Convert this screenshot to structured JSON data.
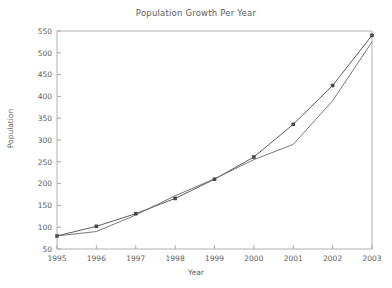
{
  "chart_data": {
    "type": "line",
    "title": "Population Growth Per Year",
    "xlabel": "Year",
    "ylabel": "Population",
    "x": [
      1995,
      1996,
      1997,
      1998,
      1999,
      2000,
      2001,
      2002,
      2003
    ],
    "categories": [
      "1995",
      "1996",
      "1997",
      "1998",
      "1999",
      "2000",
      "2001",
      "2002",
      "2003"
    ],
    "xtick_labels": [
      "1995",
      "1996",
      "1997",
      "1998",
      "1999",
      "2000",
      "2001",
      "2002",
      "2003"
    ],
    "ytick_labels": [
      "50",
      "100",
      "150",
      "200",
      "250",
      "300",
      "350",
      "400",
      "450",
      "500",
      "550"
    ],
    "yticks": [
      50,
      100,
      150,
      200,
      250,
      300,
      350,
      400,
      450,
      500,
      550
    ],
    "xlim": [
      1995,
      2003
    ],
    "ylim": [
      50,
      550
    ],
    "grid": false,
    "legend": "none",
    "series": [
      {
        "name": "population-markers",
        "marker": "square",
        "color": "#4a4a4a",
        "values": [
          80,
          102,
          131,
          166,
          210,
          261,
          336,
          425,
          540
        ]
      },
      {
        "name": "population-trend",
        "marker": "none",
        "color": "#6a6a6a",
        "values": [
          80,
          90,
          128,
          172,
          211,
          255,
          290,
          390,
          525
        ]
      }
    ]
  },
  "axes": {
    "frame_color": "#b0b0b0",
    "tick_color": "#a8a8a8"
  }
}
